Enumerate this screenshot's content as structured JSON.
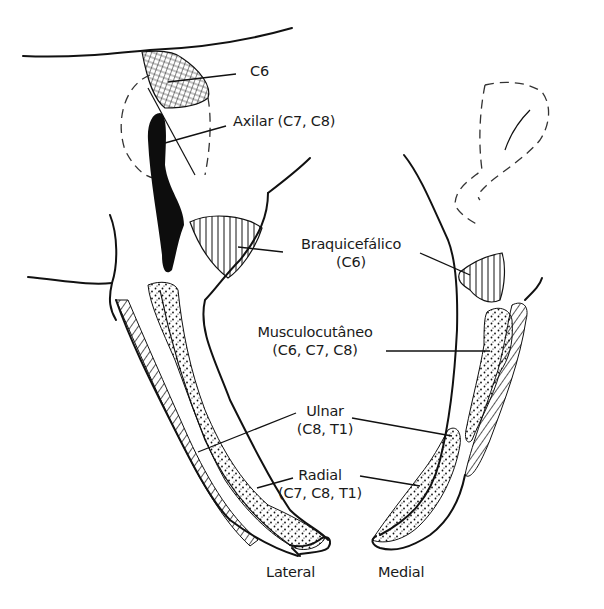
{
  "figure": {
    "type": "anatomical-diagram",
    "views": [
      {
        "id": "lateral",
        "label": "Lateral"
      },
      {
        "id": "medial",
        "label": "Medial"
      }
    ]
  },
  "labels": {
    "c6": "C6",
    "axilar": "Axilar (C7, C8)",
    "braquicefalico_name": "Braquicefálico",
    "braquicefalico_roots": "(C6)",
    "musculocutaneo_name": "Musculocutâneo",
    "musculocutaneo_roots": "(C6, C7, C8)",
    "ulnar_name": "Ulnar",
    "ulnar_roots": "(C8, T1)",
    "radial_name": "Radial",
    "radial_roots": "(C7, C8, T1)",
    "lateral": "Lateral",
    "medial": "Medial"
  },
  "legend_patterns": {
    "c6": "cross-hatched",
    "axilar": "solid-black",
    "braquicefalico": "vertical-lines",
    "musculocutaneo": "stippled",
    "ulnar": "diagonal-hatched",
    "radial": "stippled"
  },
  "colors": {
    "ink": "#111111",
    "background": "#ffffff"
  }
}
